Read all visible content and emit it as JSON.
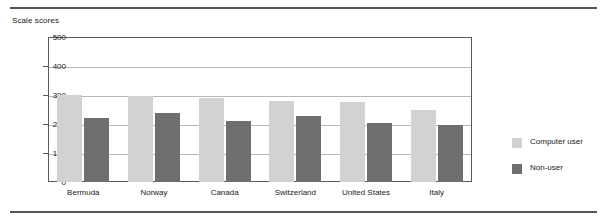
{
  "chart_data": {
    "type": "bar",
    "title": "",
    "subtitle": "",
    "ylabel": "Scale scores",
    "xlabel": "",
    "ylim": [
      0,
      500
    ],
    "yticks": [
      0,
      100,
      200,
      300,
      400,
      500
    ],
    "ytick_labels": [
      "0",
      "100",
      "200",
      "300",
      "400",
      "500"
    ],
    "grid": true,
    "grid_axis": "y",
    "legend_position": "right",
    "categories": [
      "Bermuda",
      "Norway",
      "Canada",
      "Switzerland",
      "United States",
      "Italy"
    ],
    "series": [
      {
        "name": "Computer user",
        "color": "#d2d2d2",
        "values": [
          300,
          298,
          288,
          278,
          277,
          247
        ]
      },
      {
        "name": "Non-user",
        "color": "#6e6e6e",
        "values": [
          221,
          238,
          212,
          229,
          204,
          198
        ]
      }
    ]
  },
  "legend": {
    "items": [
      {
        "label": "Computer user",
        "color": "#d2d2d2"
      },
      {
        "label": "Non-user",
        "color": "#6e6e6e"
      }
    ]
  }
}
